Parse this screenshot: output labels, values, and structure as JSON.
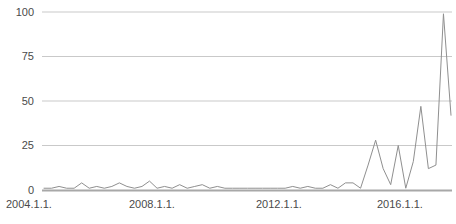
{
  "chart_data": {
    "type": "line",
    "title": "",
    "subtitle": "",
    "xlabel": "",
    "ylabel": "",
    "grid": true,
    "legend": "none",
    "xlim": [
      "2004.1.1.",
      "2017.7.1."
    ],
    "ylim": [
      0,
      100
    ],
    "yticks": [
      0,
      25,
      50,
      75,
      100
    ],
    "ytick_labels": [
      "0",
      "25",
      "50",
      "75",
      "100"
    ],
    "xticks": [
      "2004.1.1.",
      "2008.1.1.",
      "2012.1.1.",
      "2016.1.1."
    ],
    "xtick_labels": [
      "2004.1.1.",
      "2008.1.1.",
      "2012.1.1.",
      "2016.1.1."
    ],
    "series": [
      {
        "name": "search interest",
        "color": "#8f8f8f",
        "x": [
          "2004.1.1.",
          "2004.4.1.",
          "2004.7.1.",
          "2004.10.1.",
          "2005.1.1.",
          "2005.4.1.",
          "2005.7.1.",
          "2005.10.1.",
          "2006.1.1.",
          "2006.4.1.",
          "2006.7.1.",
          "2006.10.1.",
          "2007.1.1.",
          "2007.4.1.",
          "2007.7.1.",
          "2007.10.1.",
          "2008.1.1.",
          "2008.4.1.",
          "2008.7.1.",
          "2008.10.1.",
          "2009.1.1.",
          "2009.4.1.",
          "2009.7.1.",
          "2009.10.1.",
          "2010.1.1.",
          "2010.4.1.",
          "2010.7.1.",
          "2010.10.1.",
          "2011.1.1.",
          "2011.4.1.",
          "2011.7.1.",
          "2011.10.1.",
          "2012.1.1.",
          "2012.4.1.",
          "2012.7.1.",
          "2012.10.1.",
          "2013.1.1.",
          "2013.4.1.",
          "2013.7.1.",
          "2013.10.1.",
          "2014.1.1.",
          "2014.4.1.",
          "2014.7.1.",
          "2014.10.1.",
          "2015.1.1.",
          "2015.4.1.",
          "2015.7.1.",
          "2015.10.1.",
          "2016.1.1.",
          "2016.4.1.",
          "2016.7.1.",
          "2016.10.1.",
          "2017.1.1.",
          "2017.4.1.",
          "2017.7.1."
        ],
        "values": [
          1,
          1,
          2,
          1,
          1,
          4,
          1,
          2,
          1,
          2,
          4,
          2,
          1,
          2,
          5,
          1,
          2,
          1,
          3,
          1,
          2,
          3,
          1,
          2,
          1,
          1,
          1,
          1,
          1,
          1,
          1,
          1,
          1,
          2,
          1,
          2,
          1,
          1,
          3,
          1,
          4,
          4,
          1,
          14,
          28,
          12,
          3,
          25,
          1,
          16,
          47,
          12,
          14,
          99,
          42
        ],
        "peaks": [
          {
            "x": "2015.1.1.",
            "value": 28
          },
          {
            "x": "2015.10.1.",
            "value": 25
          },
          {
            "x": "2016.7.1.",
            "value": 47
          },
          {
            "x": "2017.4.1.",
            "value": 99
          }
        ]
      }
    ]
  },
  "axes": {
    "y_labels": [
      "100",
      "75",
      "50",
      "25",
      "0"
    ],
    "x_labels": [
      "2004.1.1.",
      "2008.1.1.",
      "2012.1.1.",
      "2016.1.1."
    ]
  },
  "colors": {
    "line": "#8f8f8f",
    "grid": "#c9c9c9",
    "axis": "#9a9a9a",
    "text": "#4a4a4a",
    "background": "#ffffff"
  }
}
